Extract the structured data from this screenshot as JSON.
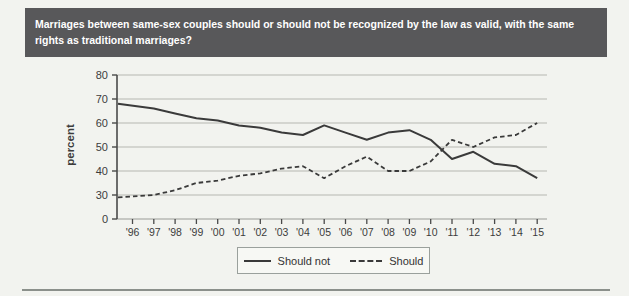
{
  "header": {
    "question": "Marriages between same-sex couples should or should not be recognized by the law as valid, with the same rights as traditional marriages?"
  },
  "colors": {
    "banner_bg": "#58585a",
    "banner_text": "#ffffff",
    "line": "#3a3a3a",
    "gridline": "#b5b7b2",
    "page_bg": "#f2f3ef"
  },
  "chart_data": {
    "type": "line",
    "title": "",
    "xlabel": "",
    "ylabel": "percent",
    "x_tick_labels": [
      "'96",
      "'97",
      "'98",
      "'99",
      "'00",
      "'01",
      "'02",
      "'03",
      "'04",
      "'05",
      "'06",
      "'07",
      "'08",
      "'09",
      "'10",
      "'11",
      "'12",
      "'13",
      "'14",
      "'15"
    ],
    "y_ticks": [
      80,
      70,
      60,
      50,
      40,
      30,
      0
    ],
    "ylim": [
      0,
      80
    ],
    "axis_note": "y-axis truncated: the span between 0 and 30 is compressed to one gridline step",
    "grid": true,
    "legend_position": "bottom-center",
    "series": [
      {
        "name": "Should not",
        "style": "solid",
        "values": [
          68,
          66,
          64,
          62,
          61,
          59,
          58,
          56,
          55,
          59,
          56,
          53,
          56,
          57,
          53,
          45,
          48,
          43,
          42,
          37
        ]
      },
      {
        "name": "Should",
        "style": "dashed",
        "values": [
          27,
          30,
          32,
          35,
          36,
          38,
          39,
          41,
          42,
          37,
          42,
          46,
          40,
          40,
          44,
          53,
          50,
          54,
          55,
          60
        ]
      }
    ]
  }
}
